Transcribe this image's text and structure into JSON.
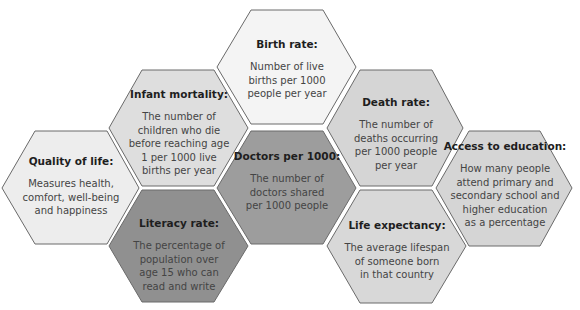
{
  "diagram": {
    "hexagons": [
      {
        "id": "birth-rate",
        "title": "Birth rate:",
        "description": [
          "Number of live",
          "births per 1000",
          "people per year"
        ],
        "fill": "#f4f4f4",
        "points": "251,10 323,10 356,67 323,124 251,124 217,67",
        "text_box": {
          "left": 222,
          "top": 38,
          "width": 130
        }
      },
      {
        "id": "infant-mortality",
        "title": "Infant mortality:",
        "description": [
          "The number of",
          "children who die",
          "before reaching age",
          "1 per 1000 live",
          "births per year"
        ],
        "fill": "#dedede",
        "points": "142,70 214,70 248,128 214,186 142,186 109,128",
        "text_box": {
          "left": 112,
          "top": 88,
          "width": 134
        }
      },
      {
        "id": "death-rate",
        "title": "Death rate:",
        "description": [
          "The number of",
          "deaths occurring",
          "per 1000 people",
          "per year"
        ],
        "fill": "#d5d5d5",
        "points": "360,70 432,70 463,128 432,186 360,186 327,128",
        "text_box": {
          "left": 332,
          "top": 96,
          "width": 128
        }
      },
      {
        "id": "quality-of-life",
        "title": "Quality of life:",
        "description": [
          "Measures health,",
          "comfort, well-being",
          "and happiness"
        ],
        "fill": "#ededed",
        "points": "35,131 107,131 139,188 107,244 35,244 2,188",
        "text_box": {
          "left": 6,
          "top": 155,
          "width": 130
        }
      },
      {
        "id": "doctors-per-1000",
        "title": "Doctors per 1000:",
        "description": [
          "The number of",
          "doctors shared",
          "per 1000 people"
        ],
        "fill": "#9d9d9d",
        "points": "251,131 323,131 356,188 323,244 251,244 217,188",
        "text_box": {
          "left": 224,
          "top": 150,
          "width": 126
        }
      },
      {
        "id": "access-to-education",
        "title": "Access to education:",
        "description": [
          "How many people",
          "attend primary and",
          "secondary school and",
          "higher education",
          "as a percentage"
        ],
        "fill": "#d5d5d5",
        "points": "469,131 540,131 572,188 540,246 469,246 436,188",
        "text_box": {
          "left": 440,
          "top": 140,
          "width": 130
        }
      },
      {
        "id": "literacy-rate",
        "title": "Literacy rate:",
        "description": [
          "The percentage of",
          "population over",
          "age 15 who can",
          "read and write"
        ],
        "fill": "#909090",
        "points": "142,190 214,190 248,246 214,302 142,302 109,246",
        "text_box": {
          "left": 114,
          "top": 217,
          "width": 130
        }
      },
      {
        "id": "life-expectancy",
        "title": "Life expectancy:",
        "description": [
          "The average lifespan",
          "of someone born",
          "in that country"
        ],
        "fill": "#d8d8d8",
        "points": "360,190 432,190 466,246 432,303 360,303 327,246",
        "text_box": {
          "left": 330,
          "top": 219,
          "width": 134
        }
      }
    ],
    "stroke": "#6a6a6a"
  }
}
